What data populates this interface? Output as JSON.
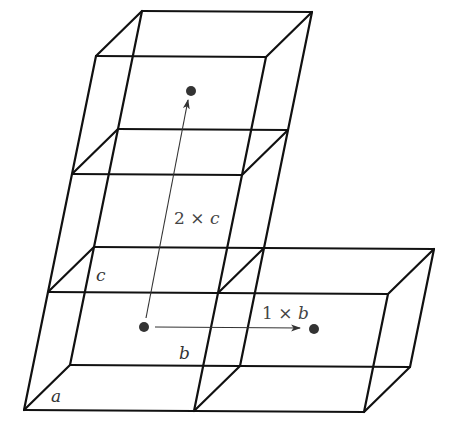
{
  "figure": {
    "colors": {
      "edges": "#111111",
      "vectors": "#333333",
      "points": "#333333"
    }
  },
  "labels": {
    "a": "a",
    "b": "b",
    "c": "c"
  },
  "vectors": [
    {
      "id": "translation-c",
      "coefficient": "2",
      "times": "×",
      "axis": "c"
    },
    {
      "id": "translation-b",
      "coefficient": "1",
      "times": "×",
      "axis": "b"
    }
  ]
}
